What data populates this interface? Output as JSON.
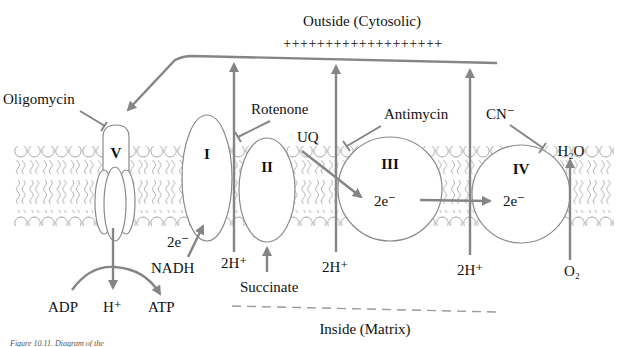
{
  "diagram": {
    "regions": {
      "outside_label": "Outside (Cytosolic)",
      "inside_label": "Inside (Matrix)",
      "charge_marks": "+ + + + + + + + + + + + + + + + + + +"
    },
    "complexes": {
      "I": "I",
      "II": "II",
      "III": "III",
      "IV": "IV",
      "V": "V"
    },
    "inhibitors": {
      "oligomycin": "Oligomycin",
      "rotenone": "Rotenone",
      "antimycin": "Antimycin",
      "cyanide": "CN⁻"
    },
    "substrates": {
      "nadh": "NADH",
      "succinate": "Succinate",
      "ubiquinone": "UQ",
      "oxygen": "O₂",
      "water": "H₂O",
      "adp": "ADP",
      "atp": "ATP",
      "proton": "H⁺"
    },
    "electrons": {
      "complex_I": "2e⁻",
      "complex_III": "2e⁻",
      "complex_IV": "2e⁻"
    },
    "proton_pumps": {
      "complex_I": "2H⁺",
      "complex_III": "2H⁺",
      "complex_IV": "2H⁺"
    },
    "caption": "Figure 10.11. Diagram of the"
  },
  "colors": {
    "arrow": "#858585",
    "outline": "#8a8a8a",
    "text": "#111111",
    "background": "#ffffff"
  }
}
